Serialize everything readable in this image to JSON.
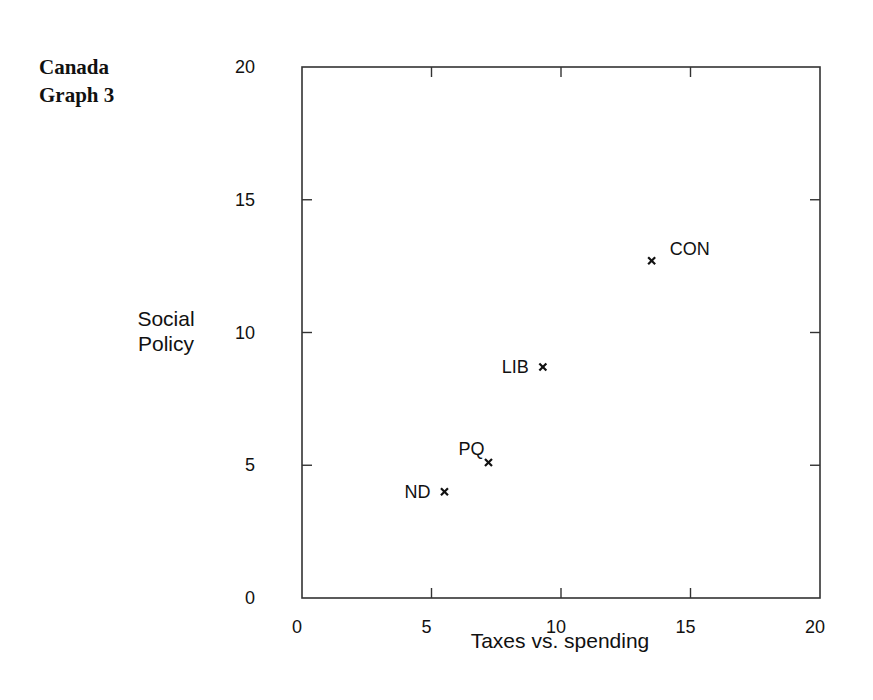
{
  "title": {
    "line1": "Canada",
    "line2": "Graph 3"
  },
  "chart_data": {
    "type": "scatter",
    "title": "Canada Graph 3",
    "xlabel": "Taxes vs. spending",
    "ylabel": "Social Policy",
    "ylabel_lines": [
      "Social",
      "Policy"
    ],
    "xlim": [
      0,
      20
    ],
    "ylim": [
      0,
      20
    ],
    "xticks": [
      0,
      5,
      10,
      15,
      20
    ],
    "yticks": [
      0,
      5,
      10,
      15,
      20
    ],
    "grid": false,
    "legend": null,
    "marker": "x",
    "points": [
      {
        "label": "CON",
        "x": 13.5,
        "y": 12.7,
        "label_position": "right"
      },
      {
        "label": "LIB",
        "x": 9.3,
        "y": 8.7,
        "label_position": "left"
      },
      {
        "label": "PQ",
        "x": 7.2,
        "y": 5.1,
        "label_position": "upper-left"
      },
      {
        "label": "ND",
        "x": 5.5,
        "y": 4.0,
        "label_position": "left"
      }
    ]
  }
}
